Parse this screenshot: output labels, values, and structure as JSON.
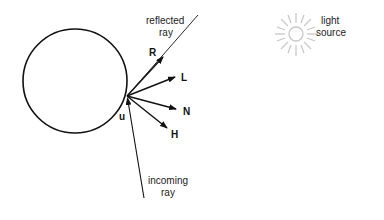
{
  "diagram": {
    "type": "ray-reflection",
    "sphere": {
      "cx": 75,
      "cy": 81,
      "r": 52
    },
    "origin": {
      "x": 127,
      "y": 96
    },
    "labels": {
      "reflected_line1": "reflected",
      "reflected_line2": "ray",
      "incoming_line1": "incoming",
      "incoming_line2": "ray",
      "light_line1": "light",
      "light_line2": "source",
      "R": "R",
      "L": "L",
      "N": "N",
      "H": "H",
      "u": "u"
    },
    "colors": {
      "stroke": "#111111",
      "light_source": "#c8c8c8"
    }
  }
}
